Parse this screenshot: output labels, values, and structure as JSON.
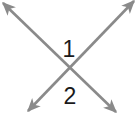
{
  "figure": {
    "width": 135,
    "height": 124,
    "background_color": "#ffffff",
    "line_color": "#8a8a8a",
    "label_color": "#1a1a1a",
    "stroke_width": 2.6
  },
  "lines": [
    {
      "name": "line-nw-se",
      "from": {
        "x": 3,
        "y": 3
      },
      "to": {
        "x": 116,
        "y": 112
      },
      "arrow_start": true,
      "arrow_end": true
    },
    {
      "name": "line-ne-sw",
      "from": {
        "x": 134,
        "y": 1
      },
      "to": {
        "x": 28,
        "y": 111
      },
      "arrow_start": true,
      "arrow_end": true
    }
  ],
  "intersection": {
    "x": 70,
    "y": 76
  },
  "labels": [
    {
      "name": "angle-label-1",
      "text": "1",
      "x": 69,
      "y": 50
    },
    {
      "name": "angle-label-2",
      "text": "2",
      "x": 70,
      "y": 97
    }
  ],
  "labels_map": {
    "one": "1",
    "two": "2"
  }
}
